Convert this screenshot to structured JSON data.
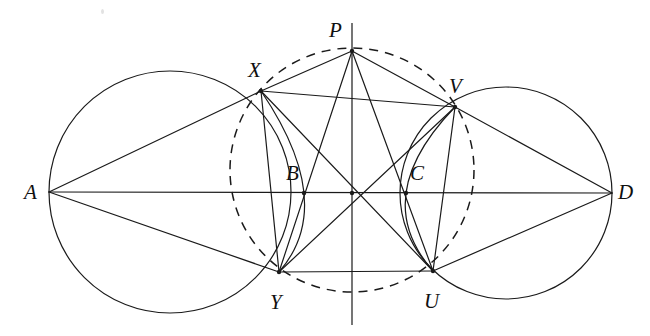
{
  "figure": {
    "width": 650,
    "height": 336,
    "stroke_color": "#1a1a1a",
    "background_color": "#ffffff",
    "line_width": 1.2,
    "dash_pattern": "9 7"
  },
  "points": {
    "A": {
      "label": "A",
      "x": 49,
      "y": 192,
      "label_x": 24,
      "label_y": 182
    },
    "D": {
      "label": "D",
      "x": 612,
      "y": 193,
      "label_x": 618,
      "label_y": 182
    },
    "P": {
      "label": "P",
      "x": 352,
      "y": 51,
      "label_x": 329,
      "label_y": 20
    },
    "X": {
      "label": "X",
      "x": 261,
      "y": 91,
      "label_x": 248,
      "label_y": 60
    },
    "V": {
      "label": "V",
      "x": 455,
      "y": 107,
      "label_x": 449,
      "label_y": 76
    },
    "Y": {
      "label": "Y",
      "x": 279,
      "y": 272,
      "label_x": 270,
      "label_y": 292
    },
    "U": {
      "label": "U",
      "x": 433,
      "y": 271,
      "label_x": 424,
      "label_y": 291
    },
    "B": {
      "label": "B",
      "x": 304,
      "y": 193,
      "label_x": 286,
      "label_y": 163
    },
    "C": {
      "label": "C",
      "x": 406,
      "y": 193,
      "label_x": 410,
      "label_y": 163
    },
    "center": {
      "label": "",
      "x": 352,
      "y": 193
    }
  },
  "circles": {
    "left_circle": {
      "cx": 170,
      "cy": 192,
      "r": 121,
      "style": "solid"
    },
    "right_circle": {
      "cx": 506,
      "cy": 193,
      "r": 106,
      "style": "solid"
    },
    "circumcircle": {
      "cx": 352,
      "cy": 170,
      "r": 122,
      "style": "dashed"
    }
  },
  "arcs": {
    "arc_XBY": {
      "from": "X",
      "through": "B",
      "to": "Y",
      "style": "solid"
    },
    "arc_VCU": {
      "from": "V",
      "through": "C",
      "to": "U",
      "style": "solid"
    }
  },
  "segments": [
    {
      "from": "A",
      "to": "D",
      "name": "baseline-AD",
      "style": "solid"
    },
    {
      "from": "A",
      "to": "X",
      "name": "segment-AX",
      "style": "solid"
    },
    {
      "from": "A",
      "to": "Y",
      "name": "segment-AY",
      "style": "solid"
    },
    {
      "from": "D",
      "to": "V",
      "name": "segment-DV",
      "style": "solid"
    },
    {
      "from": "D",
      "to": "U",
      "name": "segment-DU",
      "style": "solid"
    },
    {
      "from": "P",
      "to": "X",
      "name": "pentagon-side-PX",
      "style": "solid"
    },
    {
      "from": "X",
      "to": "Y",
      "name": "pentagon-side-XY",
      "style": "solid"
    },
    {
      "from": "Y",
      "to": "U",
      "name": "pentagon-side-YU",
      "style": "solid"
    },
    {
      "from": "U",
      "to": "V",
      "name": "pentagon-side-UV",
      "style": "solid"
    },
    {
      "from": "V",
      "to": "P",
      "name": "pentagon-side-VP",
      "style": "solid"
    },
    {
      "from": "P",
      "to": "Y",
      "name": "diagonal-PY",
      "style": "solid"
    },
    {
      "from": "P",
      "to": "U",
      "name": "diagonal-PU",
      "style": "solid"
    },
    {
      "from": "X",
      "to": "V",
      "name": "diagonal-XV",
      "style": "solid"
    },
    {
      "from": "X",
      "to": "U",
      "name": "diagonal-XU",
      "style": "solid"
    },
    {
      "from": "Y",
      "to": "V",
      "name": "diagonal-YV",
      "style": "solid"
    }
  ],
  "axis": {
    "vertical_axis": {
      "x": 352,
      "y1": 23,
      "y2": 325,
      "name": "vertical-axis",
      "style": "solid"
    }
  },
  "vertex_dots": [
    "P",
    "X",
    "V",
    "Y",
    "U",
    "B",
    "C",
    "center"
  ]
}
